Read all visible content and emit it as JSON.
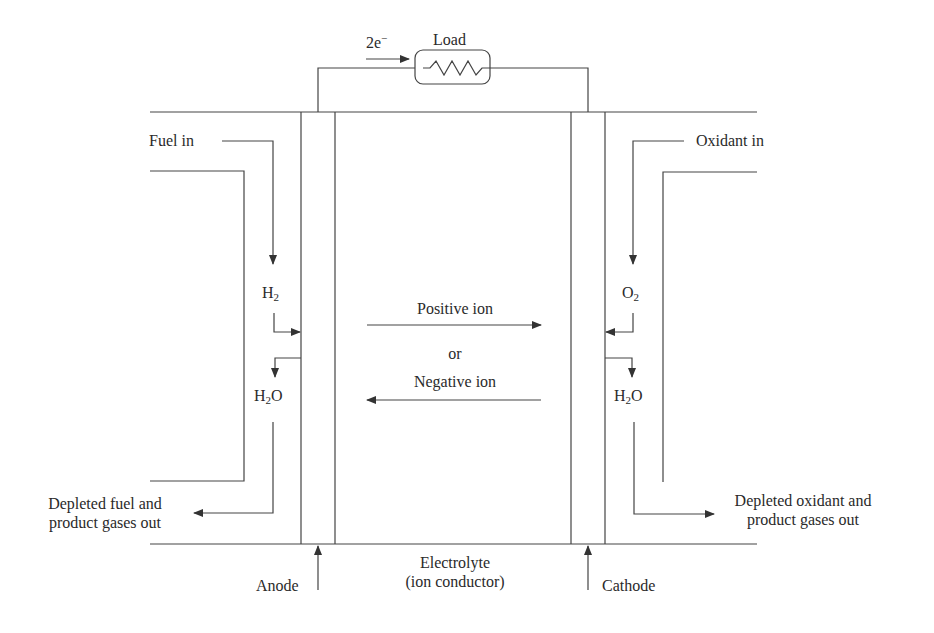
{
  "diagram": {
    "type": "fuel-cell-schematic",
    "line_color": "#444444",
    "text_color": "#2a2a2a",
    "circuit": {
      "electron_label_base": "2e",
      "electron_label_sup": "−",
      "load_label": "Load"
    },
    "anode_side": {
      "fuel_in": "Fuel in",
      "reactant": {
        "base": "H",
        "sub": "2",
        "suffix": ""
      },
      "product": {
        "base": "H",
        "sub": "2",
        "suffix": "O"
      },
      "exhaust_line1": "Depleted fuel and",
      "exhaust_line2": "product gases out",
      "electrode_label": "Anode"
    },
    "cathode_side": {
      "oxidant_in": "Oxidant in",
      "reactant": {
        "base": "O",
        "sub": "2",
        "suffix": ""
      },
      "product": {
        "base": "H",
        "sub": "2",
        "suffix": "O"
      },
      "exhaust_line1": "Depleted oxidant and",
      "exhaust_line2": "product gases out",
      "electrode_label": "Cathode"
    },
    "electrolyte": {
      "positive_ion": "Positive ion",
      "or": "or",
      "negative_ion": "Negative ion",
      "label_line1": "Electrolyte",
      "label_line2": "(ion conductor)"
    }
  }
}
